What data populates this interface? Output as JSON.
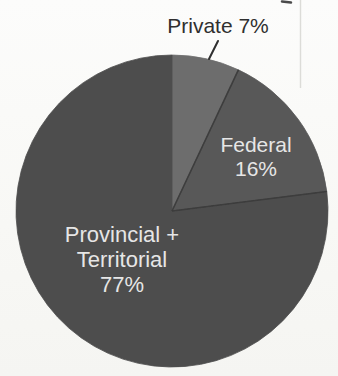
{
  "page": {
    "background_top": "#fcfcfb",
    "background_bottom": "#f5f5f2"
  },
  "chart_data": {
    "type": "pie",
    "title": "",
    "categories": [
      "Private",
      "Federal",
      "Provincial + Territorial"
    ],
    "values": [
      7,
      16,
      77
    ],
    "unit": "%",
    "total": 100,
    "start_angle_deg": 0,
    "clockwise": true,
    "legend": "none",
    "geometry": {
      "cx": 172,
      "cy": 211,
      "r": 156,
      "edge_blur": 0.55
    },
    "divider_color": "#3c3c3c",
    "divider_width": 1.6,
    "slices": [
      {
        "id": "private",
        "label": "Private",
        "pct": 7,
        "display_text": "Private 7%",
        "color": "#6d6d6d",
        "divider_after": true,
        "label_layout": {
          "placement": "outside",
          "lines": [
            "Private 7%"
          ],
          "x": 218,
          "y": 33,
          "line_height": 25,
          "font_size": 21,
          "color": "#2f2f2f"
        }
      },
      {
        "id": "federal",
        "label": "Federal",
        "pct": 16,
        "display_text": "Federal 16%",
        "color": "#595959",
        "divider_after": true,
        "label_layout": {
          "placement": "inside",
          "lines": [
            "Federal",
            "16%"
          ],
          "x": 256,
          "y": 152,
          "line_height": 24,
          "font_size": 21,
          "color": "#e6e6e6"
        }
      },
      {
        "id": "provincial-territorial",
        "label": "Provincial + Territorial",
        "pct": 77,
        "display_text": "Provincial + Territorial 77%",
        "color": "#4e4e4e",
        "divider_after": false,
        "label_layout": {
          "placement": "inside",
          "lines": [
            "Provincial +",
            "Territorial",
            "77%"
          ],
          "x": 122,
          "y": 242,
          "line_height": 25,
          "font_size": 22,
          "color": "#e6e6e6"
        }
      }
    ],
    "leader_line": {
      "x1": 218,
      "y1": 41,
      "x2": 209,
      "y2": 59,
      "color": "#2f2f2f",
      "width": 2
    },
    "artifacts": {
      "vertical_line": {
        "x": 300.5,
        "y1": 0,
        "y2": 88,
        "color": "#dcdcd8",
        "width": 1.4
      },
      "top_edge_mark": {
        "x1": 282,
        "y1": 1.5,
        "x2": 291,
        "y2": 2.5,
        "color": "#4a4a4a",
        "width": 2.5
      }
    }
  }
}
